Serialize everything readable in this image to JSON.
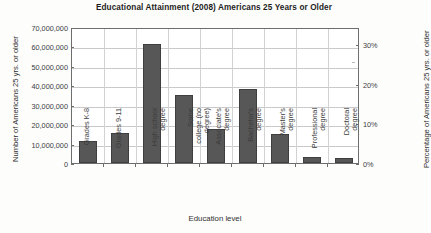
{
  "chart_data": {
    "type": "bar",
    "title": "Educational Attainment (2008) Americans 25 Years or Older",
    "xlabel": "Education level",
    "ylabel": "Number of Americans 25 yrs. or older",
    "ylabel_right": "Percentage of Americans 25 yrs. or older",
    "categories": [
      "Grades K-8",
      "Grades 9-11",
      "High school\ndegree",
      "Some\ncollege (no\ndegree)",
      "Associate's\ndegree",
      "Bachelor's\ndegree",
      "Master's\ndegree",
      "Professional\ndegree",
      "Doctoral\ndegree"
    ],
    "values": [
      11500000,
      15500000,
      61500000,
      35000000,
      17500000,
      38000000,
      15000000,
      3000000,
      2500000
    ],
    "percent_values": [
      5.6,
      7.6,
      30.1,
      17.1,
      8.6,
      18.6,
      7.3,
      1.5,
      1.2
    ],
    "ylim": [
      0,
      70000000
    ],
    "ylim_right": [
      0,
      34.3
    ],
    "ytick_labels": [
      "70,000,000",
      "60,000,000",
      "50,000,000",
      "40,000,000",
      "30,000,000",
      "20,000,000",
      "10,000,000",
      "0"
    ],
    "ytick_values": [
      70000000,
      60000000,
      50000000,
      40000000,
      30000000,
      20000000,
      10000000,
      0
    ],
    "ytick_labels_right": [
      "30%",
      "20%",
      "10%",
      "0%"
    ],
    "ytick_values_right": [
      30,
      20,
      10,
      0
    ],
    "grid": true,
    "legend": "none",
    "bar_color": "#575757",
    "grid_color": "#c9c9c9",
    "axis_color": "#6e6e6e"
  }
}
